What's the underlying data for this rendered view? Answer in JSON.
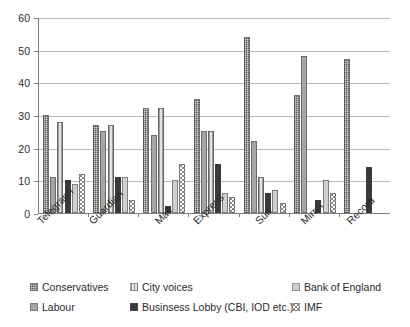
{
  "chart_data": {
    "type": "bar",
    "title": "",
    "subtitle": "",
    "xlabel": "",
    "ylabel": "",
    "ylim": [
      0,
      60
    ],
    "yticks": [
      0,
      10,
      20,
      30,
      40,
      50,
      60
    ],
    "grid": true,
    "legend_position": "bottom",
    "categories": [
      "Telegraph",
      "Guardian",
      "Mail",
      "Express",
      "Sun",
      "Mirror",
      "Record"
    ],
    "series": [
      {
        "name": "Conservatives",
        "color": "#595959",
        "pattern": "checker",
        "values": [
          30,
          27,
          32,
          35,
          54,
          36,
          47
        ]
      },
      {
        "name": "Labour",
        "color": "#a6a6a6",
        "pattern": "solid-light",
        "values": [
          11,
          25,
          24,
          25,
          22,
          48,
          0
        ]
      },
      {
        "name": "City voices",
        "color": "#e3e3e3",
        "pattern": "vertical-stripes",
        "values": [
          28,
          27,
          32,
          25,
          11,
          0,
          0
        ]
      },
      {
        "name": "Businsess Lobby (CBI, IOD etc.)",
        "color": "#3a3a3a",
        "pattern": "solid-dark",
        "values": [
          10,
          11,
          2,
          15,
          6,
          4,
          14
        ]
      },
      {
        "name": "Bank of England",
        "color": "#cfcfcf",
        "pattern": "solid-pale",
        "values": [
          9,
          11,
          10,
          6,
          7,
          10,
          0
        ]
      },
      {
        "name": "IMF",
        "color": "#ffffff",
        "pattern": "dotted",
        "values": [
          12,
          4,
          15,
          5,
          3,
          6,
          0
        ]
      }
    ]
  },
  "legend": {
    "items": [
      {
        "label": "Conservatives"
      },
      {
        "label": "City voices"
      },
      {
        "label": "Bank of England"
      },
      {
        "label": "Labour"
      },
      {
        "label": "Businsess Lobby (CBI, IOD etc.)"
      },
      {
        "label": "IMF"
      }
    ]
  },
  "axis": {
    "y_tick_labels": [
      "60",
      "50",
      "40",
      "30",
      "20",
      "10",
      "0"
    ]
  }
}
